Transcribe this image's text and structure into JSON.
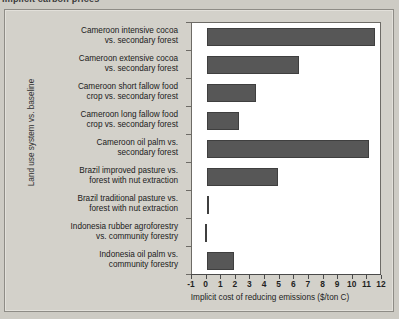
{
  "top_title": {
    "text_cutoff": "Implicit carbon prices"
  },
  "chart_data": {
    "type": "bar",
    "orientation": "horizontal",
    "title": "",
    "xlabel": "Implicit cost of reducing emissions ($/ton C)",
    "ylabel": "Land use system vs. baseline",
    "xlim": [
      -1,
      12
    ],
    "xticks": [
      -1,
      0,
      1,
      2,
      3,
      4,
      5,
      6,
      7,
      8,
      9,
      10,
      11,
      12
    ],
    "xtick_labels": [
      "-1",
      "0",
      "1",
      "2",
      "3",
      "4",
      "5",
      "6",
      "7",
      "8",
      "9",
      "10",
      "11",
      "12"
    ],
    "grid": false,
    "legend": false,
    "bar_color": "#575757",
    "plot_background": "#ffffff",
    "categories": [
      "Cameroon intensive cocoa vs. secondary forest",
      "Cameroon extensive cocoa vs. secondary forest",
      "Cameroon short fallow food crop vs. secondary forest",
      "Cameroon long fallow food crop vs. secondary forest",
      "Cameroon oil palm vs. secondary forest",
      "Brazil improved pasture vs. forest with nut extraction",
      "Brazil traditional pasture vs. forest with nut extraction",
      "Indonesia rubber agroforestry vs. community forestry",
      "Indonesia oil palm vs. community forestry"
    ],
    "category_lines": [
      [
        "Cameroon intensive cocoa",
        "vs. secondary forest"
      ],
      [
        "Cameroon extensive cocoa",
        "vs. secondary forest"
      ],
      [
        "Cameroon short fallow food",
        "crop vs. secondary forest"
      ],
      [
        "Cameroon long fallow food",
        "crop vs. secondary forest"
      ],
      [
        "Cameroon oil palm vs.",
        "secondary forest"
      ],
      [
        "Brazil improved pasture vs.",
        "forest with nut extraction"
      ],
      [
        "Brazil traditional pasture vs.",
        "forest with nut extraction"
      ],
      [
        "Indonesia rubber agroforestry",
        "vs. community forestry"
      ],
      [
        "Indonesia oil palm vs.",
        "community forestry"
      ]
    ],
    "values": [
      11.5,
      6.3,
      3.4,
      2.2,
      11.1,
      4.9,
      0.05,
      -0.1,
      1.9
    ]
  }
}
